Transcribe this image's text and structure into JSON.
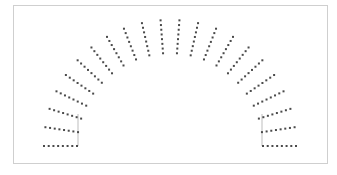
{
  "diagram": {
    "type": "radial-dot-arc",
    "frame": {
      "x": 13,
      "y": 5,
      "width": 314,
      "height": 158,
      "border_color": "#cfcfcf",
      "background": "#ffffff"
    },
    "center": {
      "x": 170,
      "y": 146
    },
    "ray_count": 22,
    "dots_per_ray": 8,
    "inner_radius": 93,
    "outer_radius": 126,
    "start_angle_deg": 180,
    "end_angle_deg": 0,
    "dot_color": "#4a4a4a",
    "dot_size": 2,
    "guide_lines": [
      {
        "x": 78,
        "y1": 114,
        "y2": 146,
        "color": "#bdbdbd"
      },
      {
        "x": 262,
        "y1": 114,
        "y2": 146,
        "color": "#bdbdbd"
      }
    ]
  }
}
